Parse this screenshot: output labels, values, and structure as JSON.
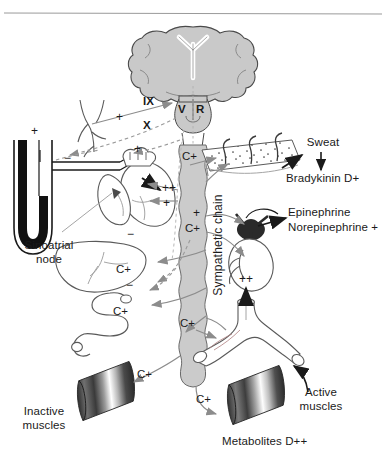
{
  "figure": {
    "top_rule": true
  },
  "anatomy": {
    "brain": "brain-coronal-section",
    "brainstem": "medulla",
    "sympathetic_chain": "Sympathetic chain",
    "carotid": "carotid-bifurcation-baroreceptor",
    "heart": "heart",
    "liver": "liver",
    "intestine": "intestine",
    "skin": "skin-sweat-glands",
    "adrenal": "adrenal-gland-kidney",
    "vessel": "blood-vessel-bifurcation",
    "manometer": "u-tube-manometer"
  },
  "labels": {
    "sinoatrial_node": "Sinoatrial\nnode",
    "sinoatrial_node_line1": "Sinoatrial",
    "sinoatrial_node_line2": "node",
    "sympathetic_chain": "Sympathetic chain",
    "sweat": "Sweat",
    "bradykinin": "Bradykinin D+",
    "epinephrine": "Epinephrine",
    "norepinephrine": "Norepinephrine +",
    "inactive_muscles_line1": "Inactive",
    "inactive_muscles_line2": "muscles",
    "active_muscles_line1": "Active",
    "active_muscles_line2": "muscles",
    "metabolites": "Metabolites D++"
  },
  "nerves": {
    "glossopharyngeal": "IX",
    "vagus": "X",
    "vasomotor": "V",
    "rate": "R"
  },
  "signs": {
    "manometer_plus": "+",
    "carotid_plus": "+",
    "heart_minus": "−",
    "heart_plus_1": "+",
    "heart_plus_double": "++",
    "heart_plus_2": "+",
    "skin_c_plus": "C+",
    "adrenal_plus": "+",
    "adrenal_c_plus": "C+",
    "liver_c_plus": "C+",
    "liver_minus_upper": "−",
    "intestine_minus": "−",
    "intestine_c_plus": "C+",
    "vessel_plus_double": "++",
    "vessel_c_plus": "C+",
    "inactive_muscle_c_plus": "C+",
    "active_muscle_c_plus": "C+"
  },
  "colors": {
    "ink": "#1a1a1a",
    "organ_stroke": "#3a3a3a",
    "tissue_fill": "#c9c9c9",
    "arrow_gray": "#8c8c8c",
    "arrow_dark": "#1a1a1a",
    "manometer_fluid": "#111111",
    "rule": "#9a9a9a",
    "muscle_dark": "#3d3d3d",
    "muscle_light": "#f2f2f2"
  }
}
